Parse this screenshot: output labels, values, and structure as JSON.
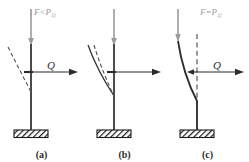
{
  "figure": {
    "colors": {
      "column": "#2b2b2b",
      "load_arrow": "#9a9a9a",
      "force_label": "#9a9a9a",
      "lateral_arrow": "#2b2b2b",
      "q_label": "#2b2b2b",
      "dashed_curve": "#555555",
      "base_hatch": "#1a1a1a",
      "background": "#ffffff"
    },
    "panels": [
      {
        "id": "a",
        "caption": "(a)",
        "force_label": "F<P",
        "force_subscript": "1j",
        "force_relation": "less-than",
        "lateral_label": "Q",
        "state": "stable-straight-column",
        "curves": [
          {
            "style": "dashed",
            "name": "perturbed-shape"
          }
        ],
        "column_style": "straight-solid"
      },
      {
        "id": "b",
        "caption": "(b)",
        "force_label": "F=P",
        "force_subscript": "1j",
        "force_relation": "equal-to",
        "lateral_label": "Q",
        "state": "critical-neutral-equilibrium",
        "curves": [
          {
            "style": "solid",
            "name": "outer-deflected-shape"
          },
          {
            "style": "dashed",
            "name": "inner-deflected-shape"
          }
        ],
        "column_style": "straight-solid"
      },
      {
        "id": "c",
        "caption": "(c)",
        "force_label": "F>P",
        "force_subscript": "1j",
        "force_relation": "greater-than",
        "lateral_label": "Q",
        "state": "unstable-buckled-column",
        "curves": [
          {
            "style": "dashed",
            "name": "undeformed-axis-reference"
          }
        ],
        "column_style": "bent-solid"
      }
    ]
  }
}
